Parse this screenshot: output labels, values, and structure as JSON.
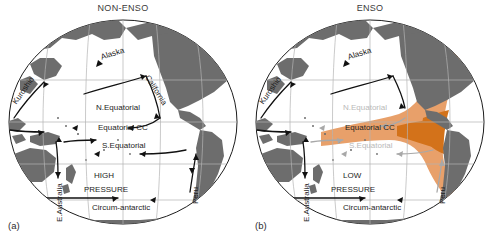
{
  "figure": {
    "panels": [
      {
        "tag": "(a)",
        "title": "NON-ENSO",
        "pressure_line1": "HIGH",
        "pressure_line2": "PRESSURE",
        "currents": [
          {
            "name": "Kuroshio",
            "label": "Kuroshio",
            "state": "active"
          },
          {
            "name": "Alaska",
            "label": "Alaska",
            "state": "active"
          },
          {
            "name": "California",
            "label": "California",
            "state": "active"
          },
          {
            "name": "N.Equatorial",
            "label": "N.Equatorial",
            "state": "active"
          },
          {
            "name": "Equatorial CC",
            "label": "Equatorial CC",
            "state": "active"
          },
          {
            "name": "S.Equatorial",
            "label": "S.Equatorial",
            "state": "active"
          },
          {
            "name": "Peru",
            "label": "Peru",
            "state": "active"
          },
          {
            "name": "E.Australia",
            "label": "E.Australia",
            "state": "active"
          },
          {
            "name": "Circum-antarctic",
            "label": "Circum-antarctic",
            "state": "active"
          }
        ],
        "warm_pool": false
      },
      {
        "tag": "(b)",
        "title": "ENSO",
        "pressure_line1": "LOW",
        "pressure_line2": "PRESSURE",
        "currents": [
          {
            "name": "Kuroshio",
            "label": "Kuroshio",
            "state": "active"
          },
          {
            "name": "Alaska",
            "label": "Alaska",
            "state": "active"
          },
          {
            "name": "N.Equatorial",
            "label": "N.Equatorial",
            "state": "weakened"
          },
          {
            "name": "Equatorial CC",
            "label": "Equatorial CC",
            "state": "active"
          },
          {
            "name": "S.Equatorial",
            "label": "S.Equatorial",
            "state": "weakened"
          },
          {
            "name": "Peru",
            "label": "Peru",
            "state": "weakened"
          },
          {
            "name": "E.Australia",
            "label": "E.Australia",
            "state": "active"
          },
          {
            "name": "Circum-antarctic",
            "label": "Circum-antarctic",
            "state": "active"
          }
        ],
        "warm_pool": true
      }
    ],
    "colors": {
      "land": "#6d6d6d",
      "ocean": "#ffffff",
      "graticule": "#b3b3b3",
      "arrow_active": "#111111",
      "arrow_weak": "#a8a8a8",
      "warm_pool_light": "#e8a06a",
      "warm_pool_core": "#d3721a",
      "title_text": "#3b3b3b",
      "label_text": "#1d1d1d",
      "label_weak": "#b9b9b9"
    }
  }
}
